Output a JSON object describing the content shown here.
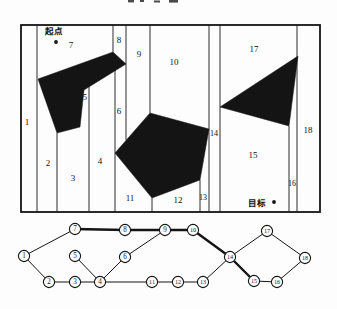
{
  "figure": {
    "ink": "#141414",
    "background": "#fdfdfd",
    "decomposition": {
      "frame": {
        "x": 21,
        "y": 25,
        "w": 299,
        "h": 187
      },
      "start": {
        "label": "起点",
        "label_x": 54,
        "label_y": 34,
        "dot_x": 56,
        "dot_y": 42
      },
      "goal": {
        "label": "目标",
        "label_x": 257,
        "label_y": 206,
        "dot_x": 274,
        "dot_y": 202
      },
      "obstacles": [
        {
          "name": "rotated-rectangle-obstacle",
          "points": "38,79 113,52 126,64 84,90 80,127 57,133"
        },
        {
          "name": "pentagon-obstacle",
          "points": "150,113 209,129 200,180 152,198 115,153"
        },
        {
          "name": "triangle-obstacle",
          "points": "220,107 298,56 289,126"
        }
      ],
      "partition_lines": [
        {
          "x": 37,
          "y1": 25,
          "y2": 212
        },
        {
          "x": 57,
          "y1": 133,
          "y2": 212
        },
        {
          "x": 89,
          "y1": 87,
          "y2": 212
        },
        {
          "x": 113,
          "y1": 25,
          "y2": 52
        },
        {
          "x": 115,
          "y1": 70,
          "y2": 212
        },
        {
          "x": 126,
          "y1": 25,
          "y2": 140
        },
        {
          "x": 150,
          "y1": 25,
          "y2": 113
        },
        {
          "x": 152,
          "y1": 198,
          "y2": 212
        },
        {
          "x": 200,
          "y1": 180,
          "y2": 212
        },
        {
          "x": 209,
          "y1": 25,
          "y2": 212
        },
        {
          "x": 220,
          "y1": 25,
          "y2": 212
        },
        {
          "x": 289,
          "y1": 126,
          "y2": 212
        },
        {
          "x": 297,
          "y1": 25,
          "y2": 212
        }
      ],
      "cell_labels": [
        {
          "n": "1",
          "x": 27,
          "y": 125,
          "s": 9
        },
        {
          "n": "2",
          "x": 48,
          "y": 166,
          "s": 9
        },
        {
          "n": "3",
          "x": 73,
          "y": 181,
          "s": 9
        },
        {
          "n": "4",
          "x": 100,
          "y": 164,
          "s": 9
        },
        {
          "n": "5",
          "x": 85,
          "y": 100,
          "s": 8
        },
        {
          "n": "6",
          "x": 119,
          "y": 114,
          "s": 9
        },
        {
          "n": "7",
          "x": 71,
          "y": 48,
          "s": 9
        },
        {
          "n": "8",
          "x": 119,
          "y": 43,
          "s": 9
        },
        {
          "n": "9",
          "x": 139,
          "y": 57,
          "s": 9
        },
        {
          "n": "10",
          "x": 174,
          "y": 65,
          "s": 9
        },
        {
          "n": "11",
          "x": 130,
          "y": 201,
          "s": 9
        },
        {
          "n": "12",
          "x": 178,
          "y": 203,
          "s": 9
        },
        {
          "n": "13",
          "x": 203,
          "y": 200,
          "s": 8
        },
        {
          "n": "14",
          "x": 214,
          "y": 136,
          "s": 8
        },
        {
          "n": "15",
          "x": 253,
          "y": 158,
          "s": 9
        },
        {
          "n": "16",
          "x": 292,
          "y": 186,
          "s": 8
        },
        {
          "n": "17",
          "x": 254,
          "y": 52,
          "s": 9
        },
        {
          "n": "18",
          "x": 308,
          "y": 133,
          "s": 9
        }
      ]
    },
    "graph": {
      "node_radius": 5.6,
      "nodes": [
        {
          "id": "1",
          "x": 24,
          "y": 256
        },
        {
          "id": "2",
          "x": 49,
          "y": 282
        },
        {
          "id": "3",
          "x": 75,
          "y": 282
        },
        {
          "id": "4",
          "x": 100,
          "y": 282
        },
        {
          "id": "5",
          "x": 75,
          "y": 256
        },
        {
          "id": "6",
          "x": 125,
          "y": 257
        },
        {
          "id": "7",
          "x": 75,
          "y": 229
        },
        {
          "id": "8",
          "x": 125,
          "y": 230
        },
        {
          "id": "9",
          "x": 165,
          "y": 230
        },
        {
          "id": "10",
          "x": 193,
          "y": 230
        },
        {
          "id": "11",
          "x": 152,
          "y": 282
        },
        {
          "id": "12",
          "x": 178,
          "y": 282
        },
        {
          "id": "13",
          "x": 203,
          "y": 282
        },
        {
          "id": "14",
          "x": 230,
          "y": 257
        },
        {
          "id": "15",
          "x": 254,
          "y": 281
        },
        {
          "id": "16",
          "x": 277,
          "y": 282
        },
        {
          "id": "17",
          "x": 267,
          "y": 231
        },
        {
          "id": "18",
          "x": 305,
          "y": 258
        }
      ],
      "edges": [
        {
          "from": "1",
          "to": "7",
          "bold": false
        },
        {
          "from": "1",
          "to": "2",
          "bold": false
        },
        {
          "from": "2",
          "to": "3",
          "bold": false
        },
        {
          "from": "3",
          "to": "4",
          "bold": false
        },
        {
          "from": "5",
          "to": "4",
          "bold": false
        },
        {
          "from": "4",
          "to": "6",
          "bold": false
        },
        {
          "from": "4",
          "to": "11",
          "bold": false
        },
        {
          "from": "6",
          "to": "9",
          "bold": false
        },
        {
          "from": "7",
          "to": "8",
          "bold": true
        },
        {
          "from": "8",
          "to": "9",
          "bold": true
        },
        {
          "from": "9",
          "to": "10",
          "bold": true
        },
        {
          "from": "10",
          "to": "14",
          "bold": true
        },
        {
          "from": "11",
          "to": "12",
          "bold": false
        },
        {
          "from": "12",
          "to": "13",
          "bold": false
        },
        {
          "from": "13",
          "to": "14",
          "bold": false
        },
        {
          "from": "14",
          "to": "15",
          "bold": true
        },
        {
          "from": "14",
          "to": "17",
          "bold": false
        },
        {
          "from": "15",
          "to": "16",
          "bold": false
        },
        {
          "from": "16",
          "to": "18",
          "bold": false
        },
        {
          "from": "17",
          "to": "18",
          "bold": false
        }
      ],
      "thin_width": 1.0,
      "bold_width": 2.4
    }
  }
}
